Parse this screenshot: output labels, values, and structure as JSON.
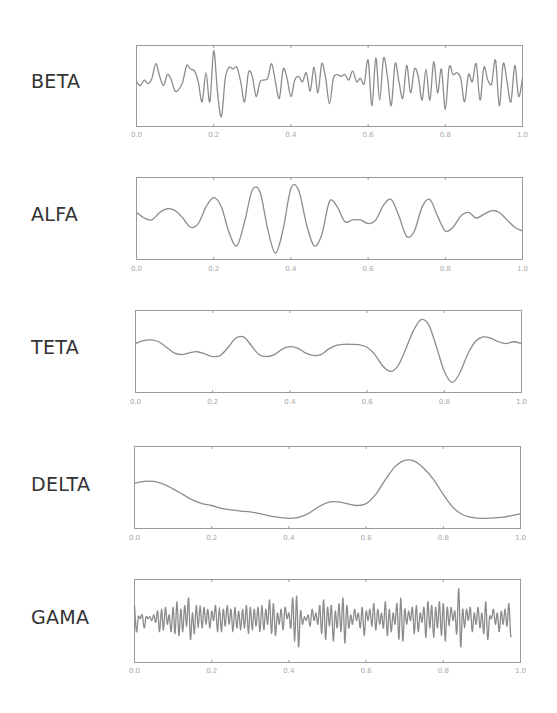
{
  "chart_data": [
    {
      "type": "line",
      "title": "BETA",
      "xlim": [
        0.0,
        1.0
      ],
      "ylim": [
        -1,
        1
      ],
      "xticks": [
        "0.0",
        "0.2",
        "0.4",
        "0.6",
        "0.8",
        "1.0"
      ],
      "grid": false,
      "legend": null,
      "x": [
        0.0,
        0.01,
        0.02,
        0.03,
        0.04,
        0.05,
        0.06,
        0.07,
        0.08,
        0.09,
        0.1,
        0.11,
        0.12,
        0.13,
        0.14,
        0.15,
        0.16,
        0.17,
        0.18,
        0.19,
        0.2,
        0.21,
        0.22,
        0.23,
        0.24,
        0.25,
        0.26,
        0.27,
        0.28,
        0.29,
        0.3,
        0.31,
        0.32,
        0.33,
        0.34,
        0.35,
        0.36,
        0.37,
        0.38,
        0.39,
        0.4,
        0.41,
        0.42,
        0.43,
        0.44,
        0.45,
        0.46,
        0.47,
        0.48,
        0.49,
        0.5,
        0.51,
        0.52,
        0.53,
        0.54,
        0.55,
        0.56,
        0.57,
        0.58,
        0.59,
        0.6,
        0.61,
        0.62,
        0.63,
        0.64,
        0.65,
        0.66,
        0.67,
        0.68,
        0.69,
        0.7,
        0.71,
        0.72,
        0.73,
        0.74,
        0.75,
        0.76,
        0.77,
        0.78,
        0.79,
        0.8,
        0.81,
        0.82,
        0.83,
        0.84,
        0.85,
        0.86,
        0.87,
        0.88,
        0.89,
        0.9,
        0.91,
        0.92,
        0.93,
        0.94,
        0.95,
        0.96,
        0.97,
        0.98,
        0.99,
        1.0
      ],
      "y": [
        0.1,
        0.0,
        0.15,
        0.05,
        0.2,
        0.6,
        0.25,
        0.0,
        0.3,
        0.15,
        -0.15,
        -0.1,
        0.1,
        0.55,
        0.45,
        0.4,
        0.1,
        -0.45,
        0.35,
        -0.45,
        0.95,
        -0.2,
        -0.85,
        0.2,
        0.5,
        0.45,
        0.5,
        0.1,
        -0.45,
        0.35,
        0.25,
        -0.3,
        0.1,
        0.15,
        0.2,
        0.6,
        0.1,
        -0.35,
        0.45,
        0.2,
        -0.3,
        0.15,
        0.25,
        0.1,
        0.35,
        -0.15,
        0.5,
        -0.2,
        0.6,
        0.2,
        -0.5,
        0.2,
        0.3,
        0.25,
        0.3,
        0.15,
        0.4,
        0.1,
        0.2,
        0.05,
        0.7,
        -0.55,
        0.75,
        -0.4,
        0.75,
        0.25,
        -0.55,
        0.6,
        0.1,
        -0.35,
        0.55,
        -0.2,
        0.45,
        0.25,
        -0.4,
        0.45,
        -0.4,
        0.65,
        -0.2,
        0.45,
        -0.65,
        0.5,
        0.3,
        0.35,
        0.2,
        -0.45,
        0.3,
        0.1,
        0.6,
        -0.4,
        0.5,
        0.15,
        0.05,
        0.7,
        -0.55,
        0.6,
        0.1,
        -0.45,
        0.55,
        -0.3,
        0.2
      ]
    },
    {
      "type": "line",
      "title": "ALFA",
      "xlim": [
        0.0,
        1.0
      ],
      "ylim": [
        -1,
        1
      ],
      "xticks": [
        "0.0",
        "0.2",
        "0.4",
        "0.6",
        "0.8",
        "1.0"
      ],
      "grid": false,
      "legend": null,
      "x": [
        0.0,
        0.02,
        0.04,
        0.06,
        0.08,
        0.1,
        0.12,
        0.14,
        0.16,
        0.18,
        0.2,
        0.22,
        0.24,
        0.26,
        0.28,
        0.3,
        0.32,
        0.34,
        0.36,
        0.38,
        0.4,
        0.42,
        0.44,
        0.46,
        0.48,
        0.5,
        0.52,
        0.54,
        0.56,
        0.58,
        0.6,
        0.62,
        0.64,
        0.66,
        0.68,
        0.7,
        0.72,
        0.74,
        0.76,
        0.78,
        0.8,
        0.82,
        0.84,
        0.86,
        0.88,
        0.9,
        0.92,
        0.94,
        0.96,
        0.98,
        1.0
      ],
      "y": [
        0.15,
        0.0,
        -0.05,
        0.15,
        0.25,
        0.2,
        0.0,
        -0.25,
        -0.15,
        0.3,
        0.55,
        0.3,
        -0.4,
        -0.75,
        -0.1,
        0.75,
        0.7,
        -0.3,
        -0.95,
        -0.3,
        0.8,
        0.75,
        -0.15,
        -0.75,
        -0.45,
        0.45,
        0.3,
        -0.1,
        -0.05,
        -0.05,
        -0.15,
        -0.05,
        0.35,
        0.5,
        0.05,
        -0.5,
        -0.35,
        0.3,
        0.5,
        0.05,
        -0.35,
        -0.25,
        0.05,
        0.15,
        0.0,
        0.1,
        0.2,
        0.15,
        -0.05,
        -0.25,
        -0.35
      ]
    },
    {
      "type": "line",
      "title": "TETA",
      "xlim": [
        0.0,
        1.0
      ],
      "ylim": [
        -1,
        1
      ],
      "xticks": [
        "0.0",
        "0.2",
        "0.4",
        "0.6",
        "0.8",
        "1.0"
      ],
      "grid": false,
      "legend": null,
      "x": [
        0.0,
        0.02,
        0.04,
        0.06,
        0.08,
        0.1,
        0.12,
        0.14,
        0.16,
        0.18,
        0.2,
        0.22,
        0.24,
        0.26,
        0.28,
        0.3,
        0.32,
        0.34,
        0.36,
        0.38,
        0.4,
        0.42,
        0.44,
        0.46,
        0.48,
        0.5,
        0.52,
        0.54,
        0.56,
        0.58,
        0.6,
        0.62,
        0.64,
        0.66,
        0.68,
        0.7,
        0.72,
        0.74,
        0.76,
        0.78,
        0.8,
        0.82,
        0.84,
        0.86,
        0.88,
        0.9,
        0.92,
        0.94,
        0.96,
        0.98,
        1.0
      ],
      "y": [
        0.2,
        0.28,
        0.3,
        0.25,
        0.1,
        -0.05,
        -0.1,
        -0.05,
        -0.02,
        -0.08,
        -0.15,
        -0.12,
        0.1,
        0.35,
        0.38,
        0.15,
        -0.1,
        -0.15,
        -0.1,
        0.05,
        0.12,
        0.08,
        -0.05,
        -0.12,
        -0.1,
        0.05,
        0.15,
        0.18,
        0.18,
        0.17,
        0.1,
        -0.1,
        -0.4,
        -0.55,
        -0.4,
        0.05,
        0.55,
        0.85,
        0.7,
        0.1,
        -0.55,
        -0.85,
        -0.6,
        -0.1,
        0.25,
        0.38,
        0.35,
        0.25,
        0.2,
        0.25,
        0.2
      ]
    },
    {
      "type": "line",
      "title": "DELTA",
      "xlim": [
        0.0,
        1.0
      ],
      "ylim": [
        -1,
        1
      ],
      "xticks": [
        "0.0",
        "0.2",
        "0.4",
        "0.6",
        "0.8",
        "1.0"
      ],
      "grid": false,
      "legend": null,
      "x": [
        0.0,
        0.025,
        0.05,
        0.075,
        0.1,
        0.125,
        0.15,
        0.175,
        0.2,
        0.225,
        0.25,
        0.275,
        0.3,
        0.325,
        0.35,
        0.375,
        0.4,
        0.425,
        0.45,
        0.475,
        0.5,
        0.525,
        0.55,
        0.575,
        0.6,
        0.625,
        0.65,
        0.675,
        0.7,
        0.725,
        0.75,
        0.775,
        0.8,
        0.825,
        0.85,
        0.875,
        0.9,
        0.925,
        0.95,
        0.975,
        1.0
      ],
      "y": [
        0.1,
        0.15,
        0.15,
        0.08,
        -0.05,
        -0.2,
        -0.35,
        -0.45,
        -0.5,
        -0.58,
        -0.62,
        -0.65,
        -0.67,
        -0.72,
        -0.78,
        -0.82,
        -0.85,
        -0.82,
        -0.72,
        -0.55,
        -0.42,
        -0.4,
        -0.45,
        -0.5,
        -0.45,
        -0.2,
        0.2,
        0.55,
        0.72,
        0.7,
        0.5,
        0.2,
        -0.2,
        -0.55,
        -0.75,
        -0.82,
        -0.85,
        -0.84,
        -0.82,
        -0.78,
        -0.72
      ]
    },
    {
      "type": "line",
      "title": "GAMA",
      "xlim": [
        0.0,
        1.0
      ],
      "ylim": [
        -1,
        1
      ],
      "xticks": [
        "0.0",
        "0.2",
        "0.4",
        "0.6",
        "0.8",
        "1.0"
      ],
      "grid": false,
      "legend": null,
      "x": [
        0.0,
        0.005,
        0.01,
        0.015,
        0.02,
        0.025,
        0.03,
        0.035,
        0.04,
        0.045,
        0.05,
        0.055,
        0.06,
        0.065,
        0.07,
        0.075,
        0.08,
        0.085,
        0.09,
        0.095,
        0.1,
        0.105,
        0.11,
        0.115,
        0.12,
        0.125,
        0.13,
        0.135,
        0.14,
        0.145,
        0.15,
        0.155,
        0.16,
        0.165,
        0.17,
        0.175,
        0.18,
        0.185,
        0.19,
        0.195,
        0.2,
        0.205,
        0.21,
        0.215,
        0.22,
        0.225,
        0.23,
        0.235,
        0.24,
        0.245,
        0.25,
        0.255,
        0.26,
        0.265,
        0.27,
        0.275,
        0.28,
        0.285,
        0.29,
        0.295,
        0.3,
        0.305,
        0.31,
        0.315,
        0.32,
        0.325,
        0.33,
        0.335,
        0.34,
        0.345,
        0.35,
        0.355,
        0.36,
        0.365,
        0.37,
        0.375,
        0.38,
        0.385,
        0.39,
        0.395,
        0.4,
        0.405,
        0.41,
        0.415,
        0.42,
        0.425,
        0.43,
        0.435,
        0.44,
        0.445,
        0.45,
        0.455,
        0.46,
        0.465,
        0.47,
        0.475,
        0.48,
        0.485,
        0.49,
        0.495,
        0.5,
        0.505,
        0.51,
        0.515,
        0.52,
        0.525,
        0.53,
        0.535,
        0.54,
        0.545,
        0.55,
        0.555,
        0.56,
        0.565,
        0.57,
        0.575,
        0.58,
        0.585,
        0.59,
        0.595,
        0.6,
        0.605,
        0.61,
        0.615,
        0.62,
        0.625,
        0.63,
        0.635,
        0.64,
        0.645,
        0.65,
        0.655,
        0.66,
        0.665,
        0.67,
        0.675,
        0.68,
        0.685,
        0.69,
        0.695,
        0.7,
        0.705,
        0.71,
        0.715,
        0.72,
        0.725,
        0.73,
        0.735,
        0.74,
        0.745,
        0.75,
        0.755,
        0.76,
        0.765,
        0.77,
        0.775,
        0.78,
        0.785,
        0.79,
        0.795,
        0.8,
        0.805,
        0.81,
        0.815,
        0.82,
        0.825,
        0.83,
        0.835,
        0.84,
        0.845,
        0.85,
        0.855,
        0.86,
        0.865,
        0.87,
        0.875,
        0.88,
        0.885,
        0.89,
        0.895,
        0.9,
        0.905,
        0.91,
        0.915,
        0.92,
        0.925,
        0.93,
        0.935,
        0.94,
        0.945,
        0.95,
        0.955,
        0.96,
        0.965,
        0.97,
        0.975,
        0.98,
        0.985,
        0.99,
        0.995,
        1.0
      ],
      "y": [
        0.4,
        -0.3,
        0.1,
        0.05,
        0.15,
        -0.2,
        0.1,
        0.05,
        0.1,
        0.0,
        0.15,
        -0.05,
        0.25,
        -0.3,
        0.3,
        -0.25,
        0.35,
        -0.1,
        0.15,
        -0.3,
        0.35,
        -0.35,
        0.5,
        -0.4,
        0.3,
        -0.3,
        0.4,
        -0.15,
        0.6,
        -0.5,
        0.2,
        -0.35,
        0.4,
        -0.2,
        0.4,
        -0.2,
        0.35,
        -0.1,
        0.3,
        -0.2,
        0.25,
        0.0,
        0.4,
        -0.3,
        0.35,
        -0.3,
        0.3,
        -0.15,
        0.4,
        -0.1,
        0.3,
        -0.3,
        0.35,
        -0.2,
        0.25,
        -0.25,
        0.3,
        -0.2,
        0.4,
        -0.35,
        0.35,
        -0.25,
        0.3,
        -0.15,
        0.35,
        -0.3,
        0.4,
        -0.25,
        0.3,
        -0.1,
        0.55,
        -0.35,
        0.45,
        -0.4,
        0.2,
        -0.1,
        0.3,
        -0.25,
        0.35,
        0.05,
        0.2,
        -0.2,
        0.6,
        -0.55,
        0.65,
        -0.7,
        0.25,
        -0.1,
        0.1,
        0.0,
        0.15,
        -0.15,
        0.3,
        0.0,
        0.2,
        -0.1,
        0.4,
        -0.35,
        0.55,
        -0.5,
        0.35,
        -0.15,
        0.4,
        -0.55,
        0.25,
        -0.2,
        0.45,
        -0.3,
        0.6,
        -0.6,
        0.4,
        -0.2,
        0.15,
        -0.1,
        0.3,
        0.0,
        0.2,
        -0.2,
        0.35,
        -0.4,
        0.25,
        0.0,
        0.3,
        -0.15,
        0.45,
        -0.25,
        0.3,
        -0.1,
        0.2,
        -0.2,
        0.5,
        -0.4,
        0.3,
        -0.3,
        0.2,
        -0.1,
        0.45,
        -0.5,
        0.6,
        -0.55,
        0.3,
        -0.1,
        0.25,
        0.0,
        0.35,
        -0.35,
        0.4,
        -0.3,
        0.2,
        -0.05,
        0.35,
        -0.45,
        0.5,
        -0.2,
        0.4,
        -0.45,
        0.35,
        -0.2,
        0.5,
        -0.4,
        0.45,
        -0.55,
        0.35,
        -0.15,
        0.35,
        0.0,
        0.25,
        -0.35,
        0.85,
        -0.7,
        0.3,
        -0.2,
        0.3,
        0.0,
        0.35,
        -0.3,
        0.2,
        -0.1,
        0.35,
        -0.2,
        0.2,
        -0.35,
        0.5,
        -0.5,
        0.1,
        0.05,
        0.3,
        -0.1,
        0.2,
        -0.3,
        0.25,
        -0.1,
        0.3,
        -0.15,
        0.45,
        -0.45,
        -0.2
      ]
    }
  ],
  "panels": [
    {
      "label": "BETA",
      "box": {
        "x": 136,
        "y": 45,
        "w": 386,
        "h": 81
      },
      "tick_y": 134
    },
    {
      "label": "ALFA",
      "box": {
        "x": 136,
        "y": 177,
        "w": 386,
        "h": 82
      },
      "tick_y": 268
    },
    {
      "label": "TETA",
      "box": {
        "x": 135,
        "y": 310,
        "w": 386,
        "h": 82
      },
      "tick_y": 401
    },
    {
      "label": "DELTA",
      "box": {
        "x": 134,
        "y": 446,
        "w": 386,
        "h": 82
      },
      "tick_y": 537
    },
    {
      "label": "GAMA",
      "box": {
        "x": 134,
        "y": 579,
        "w": 386,
        "h": 83
      },
      "tick_y": 670
    }
  ],
  "colors": {
    "line": "#8c8c8c",
    "frame": "#9a9a9a",
    "tick_text": "#a8a8a8",
    "label_text": "#333333",
    "background": "#ffffff"
  }
}
